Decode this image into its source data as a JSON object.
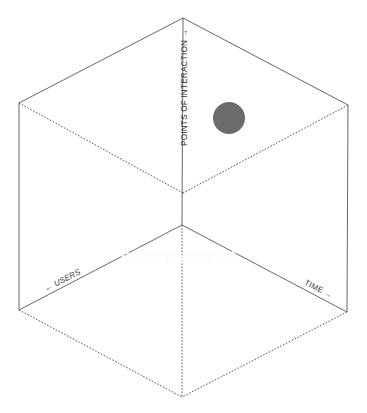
{
  "diagram": {
    "type": "isometric-cube",
    "axes": {
      "vertical": {
        "label": "POINTS OF INTERACTION",
        "arrow": "→",
        "direction": "up"
      },
      "left": {
        "label": "USERS",
        "arrow": "←",
        "direction": "left-down"
      },
      "right": {
        "label": "TIME",
        "arrow": "→",
        "direction": "right-down"
      }
    },
    "labels": {
      "poi": "POINTS OF INTERACTION →",
      "users": "← USERS",
      "time": "TIME →"
    },
    "vertices": {
      "top": [
        183,
        18
      ],
      "upper_left": [
        19,
        103
      ],
      "upper_right": [
        348,
        105
      ],
      "center_front": [
        183,
        193
      ],
      "back_bottom": [
        182,
        225
      ],
      "lower_left": [
        19,
        310
      ],
      "lower_right": [
        347,
        312
      ],
      "bottom": [
        182,
        397
      ]
    },
    "point": {
      "cx": 229,
      "cy": 118,
      "r": 16,
      "color": "#6b6b6b"
    },
    "colors": {
      "line": "#555555",
      "dotted_line": "#555555",
      "text": "#333333"
    },
    "watermark": "storyworld"
  }
}
